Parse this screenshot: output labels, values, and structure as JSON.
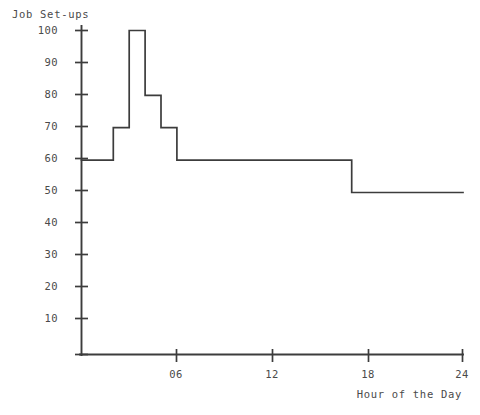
{
  "chart_data": {
    "type": "line",
    "title": "",
    "xlabel": "Hour of the Day",
    "ylabel": "Job Set-ups",
    "xlim": [
      0,
      24
    ],
    "ylim": [
      0,
      100
    ],
    "grid": false,
    "legend": "none",
    "step_style": "post",
    "xticks": [
      0,
      6,
      12,
      18,
      24
    ],
    "xticklabels": [
      "",
      "06",
      "12",
      "18",
      "24"
    ],
    "yticks": [
      10,
      20,
      30,
      40,
      50,
      60,
      70,
      80,
      90,
      100
    ],
    "yticklabels": [
      "10",
      "20",
      "30",
      "40",
      "50",
      "60",
      "70",
      "80",
      "90",
      "100"
    ],
    "x": [
      0,
      2,
      3,
      4,
      5,
      6,
      17,
      24
    ],
    "values": [
      60,
      70,
      100,
      80,
      70,
      60,
      50,
      50
    ],
    "segments": [
      {
        "from_hour": 0,
        "to_hour": 2,
        "value": 60
      },
      {
        "from_hour": 2,
        "to_hour": 3,
        "value": 70
      },
      {
        "from_hour": 3,
        "to_hour": 4,
        "value": 100
      },
      {
        "from_hour": 4,
        "to_hour": 5,
        "value": 80
      },
      {
        "from_hour": 5,
        "to_hour": 6,
        "value": 70
      },
      {
        "from_hour": 6,
        "to_hour": 17,
        "value": 60
      },
      {
        "from_hour": 17,
        "to_hour": 24,
        "value": 50
      }
    ],
    "line_color": "#3c3c3c",
    "axis_color": "#3c3c3c"
  },
  "axes": {
    "ylabel": "Job Set-ups",
    "xlabel": "Hour of the Day",
    "ytick_labels": [
      "100",
      "90",
      "80",
      "70",
      "60",
      "50",
      "40",
      "30",
      "20",
      "10"
    ],
    "xtick_labels": [
      "06",
      "12",
      "18",
      "24"
    ]
  }
}
